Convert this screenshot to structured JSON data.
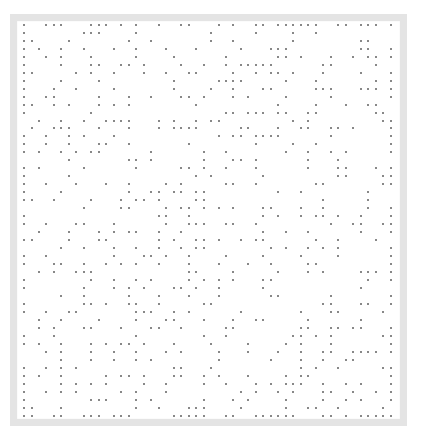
{
  "figure": {
    "frame_color": "#e4e4e4",
    "dot_color": "#7a7a7a",
    "background": "#ffffff"
  },
  "grid": {
    "columns": 50,
    "rows": 50,
    "origin_x": 23,
    "origin_y": 23.7,
    "step_x": 7.48,
    "step_y": 7.98
  },
  "dots": [
    [
      0,
      3,
      4,
      5,
      9,
      10,
      11,
      13,
      15,
      18,
      21,
      22,
      26,
      28,
      31,
      32,
      34,
      35,
      36,
      37,
      38,
      39,
      42,
      43,
      45,
      46,
      47,
      49
    ],
    [
      0,
      8,
      9,
      10,
      15,
      25,
      31,
      36,
      39
    ],
    [
      0,
      1,
      6,
      14,
      17,
      25,
      28,
      36,
      45,
      46
    ],
    [
      0,
      2,
      5,
      8,
      12,
      15,
      19,
      23,
      29,
      33,
      34,
      35,
      45,
      46,
      49
    ],
    [
      0,
      3,
      5,
      9,
      15,
      20,
      27,
      34,
      35,
      37,
      41,
      44,
      46,
      47,
      49
    ],
    [
      0,
      5,
      9,
      10,
      13,
      14,
      16,
      21,
      24,
      27,
      29,
      30,
      31,
      32,
      33,
      40,
      41,
      47
    ],
    [
      0,
      1,
      7,
      9,
      12,
      16,
      19,
      22,
      23,
      28,
      31,
      33,
      34,
      36,
      40,
      45,
      49
    ],
    [
      0,
      5,
      10,
      20,
      26,
      27,
      28,
      29,
      35,
      39,
      47,
      49
    ],
    [
      0,
      4,
      7,
      12,
      20,
      25,
      28,
      32,
      33,
      39,
      40,
      41,
      45,
      46,
      47,
      49
    ],
    [
      0,
      3,
      4,
      10,
      14,
      17,
      21,
      22,
      24,
      28,
      30,
      35,
      41,
      49
    ],
    [
      0,
      1,
      4,
      6,
      10,
      12,
      14,
      23,
      34,
      39,
      43,
      46,
      47
    ],
    [
      0,
      9,
      27,
      28,
      30,
      31,
      32,
      34,
      35,
      38,
      39,
      47,
      48
    ],
    [
      2,
      5,
      8,
      11,
      12,
      13,
      14,
      18,
      20,
      23,
      25,
      26,
      36,
      38,
      48,
      49
    ],
    [
      1,
      4,
      5,
      6,
      10,
      14,
      18,
      20,
      21,
      22,
      23,
      29,
      30,
      34,
      37,
      38,
      41,
      42,
      44,
      49
    ],
    [
      0,
      3,
      6,
      8,
      12,
      26,
      28,
      29,
      31,
      32,
      33,
      34,
      41,
      49
    ],
    [
      0,
      3,
      6,
      10,
      11,
      14,
      22,
      31,
      36,
      39,
      49
    ],
    [
      0,
      2,
      5,
      7,
      9,
      10,
      17,
      24,
      27,
      35,
      38,
      41,
      43,
      49
    ],
    [
      6,
      14,
      15,
      17,
      24,
      28,
      29,
      31,
      38,
      42
    ],
    [
      0,
      2,
      8,
      15,
      21,
      22,
      24,
      27,
      31,
      38,
      42,
      43,
      47,
      49
    ],
    [
      0,
      6,
      23,
      25,
      32,
      42,
      43,
      48,
      49
    ],
    [
      0,
      3,
      7,
      11,
      14,
      19,
      21,
      27,
      28,
      31,
      39,
      40,
      48,
      49
    ],
    [
      0,
      5,
      14,
      17,
      18,
      20,
      21,
      23,
      24,
      34,
      37,
      46
    ],
    [
      0,
      1,
      4,
      9,
      13,
      15,
      16,
      18,
      23,
      24,
      40,
      46
    ],
    [
      8,
      13,
      14,
      19,
      21,
      22,
      24,
      26,
      28,
      32,
      33,
      37,
      40,
      46,
      49
    ],
    [
      0,
      18,
      19,
      22,
      32,
      34,
      37,
      39,
      40,
      42,
      45,
      49
    ],
    [
      0,
      3,
      7,
      8,
      12,
      19,
      22,
      23,
      24,
      27,
      28,
      31,
      41,
      44,
      45,
      48,
      49
    ],
    [
      2,
      6,
      10,
      12,
      14,
      15,
      18,
      21,
      32,
      35,
      38,
      45,
      49
    ],
    [
      0,
      1,
      6,
      10,
      11,
      18,
      20,
      23,
      24,
      26,
      29,
      31,
      32,
      39,
      42,
      47
    ],
    [
      5,
      8,
      12,
      15,
      18,
      21,
      23,
      24,
      33,
      35,
      38,
      40,
      42,
      49
    ],
    [
      0,
      3,
      12,
      16,
      17,
      19,
      22,
      27,
      32,
      37,
      42,
      49
    ],
    [
      0,
      4,
      5,
      8,
      11,
      13,
      15,
      18,
      22,
      26,
      30,
      33,
      38,
      39,
      49
    ],
    [
      2,
      4,
      7,
      8,
      9,
      22,
      23,
      28,
      34,
      38,
      40,
      45,
      46,
      47,
      49
    ],
    [
      0,
      9,
      12,
      15,
      17,
      22,
      24,
      26,
      28,
      32,
      33,
      46,
      49
    ],
    [
      0,
      8,
      12,
      14,
      16,
      20,
      21,
      23,
      26,
      32,
      45
    ],
    [
      5,
      8,
      14,
      18,
      22,
      26,
      33,
      34,
      41,
      49
    ],
    [
      0,
      8,
      9,
      11,
      14,
      15,
      18,
      24,
      25,
      40,
      41,
      45,
      46,
      49
    ],
    [
      0,
      3,
      6,
      7,
      15,
      16,
      17,
      20,
      22,
      29,
      37,
      41,
      42,
      48
    ],
    [
      2,
      5,
      10,
      15,
      19,
      20,
      24,
      28,
      31,
      32,
      38,
      45
    ],
    [
      2,
      4,
      8,
      9,
      13,
      17,
      18,
      21,
      27,
      28,
      37,
      38,
      41,
      42,
      44,
      45,
      49
    ],
    [
      0,
      4,
      15,
      24,
      27,
      36,
      37,
      39,
      41,
      48,
      49
    ],
    [
      0,
      2,
      5,
      9,
      11,
      13,
      14,
      16,
      20,
      25,
      30,
      35,
      37,
      41,
      49
    ],
    [
      3,
      5,
      9,
      12,
      15,
      19,
      21,
      26,
      30,
      34,
      37,
      40,
      41,
      44,
      45,
      46,
      47,
      49
    ],
    [
      5,
      9,
      12,
      15,
      17,
      26,
      33,
      37,
      40,
      43,
      44
    ],
    [
      0,
      3,
      5,
      7,
      20,
      21,
      25,
      37,
      39,
      42,
      48,
      49
    ],
    [
      0,
      2,
      5,
      11,
      13,
      14,
      16,
      20,
      21,
      24,
      26,
      30,
      35,
      37,
      38,
      49
    ],
    [
      0,
      5,
      7,
      9,
      11,
      16,
      19,
      24,
      27,
      31,
      33,
      35,
      36,
      37,
      40,
      43,
      45,
      49
    ],
    [
      0,
      3,
      5,
      7,
      13,
      15,
      19,
      29,
      31,
      34,
      36,
      40,
      41,
      44,
      47,
      49
    ],
    [
      0,
      9,
      10,
      11,
      15,
      17,
      24,
      28,
      30,
      35,
      40,
      43,
      45,
      49
    ],
    [
      0,
      1,
      5,
      15,
      18,
      22,
      23,
      24,
      29,
      35,
      38,
      39,
      42,
      48
    ],
    [
      0,
      1,
      4,
      5,
      8,
      9,
      10,
      12,
      13,
      14,
      20,
      21,
      22,
      23,
      24,
      27,
      28,
      31,
      32,
      33,
      34,
      35,
      36,
      40,
      41,
      43,
      45,
      46,
      47,
      48,
      49
    ]
  ]
}
